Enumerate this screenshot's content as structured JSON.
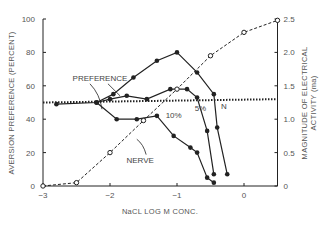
{
  "chart_data": {
    "type": "line",
    "title": "",
    "xlabel": "NaCL LOG M CONC.",
    "ylabel": "AVERSION PREFERENCE (PERCENT)",
    "y2label_line1": "MAGNITUDE OF ELECTRICAL",
    "y2label_line2": "ACTIVITY (ma)",
    "xlim": [
      -3,
      0.5
    ],
    "ylim": [
      0,
      100
    ],
    "y2lim": [
      0,
      2.5
    ],
    "xticks": [
      -3,
      -2,
      -1,
      0
    ],
    "xtick_labels": [
      "−3",
      "−2",
      "−1",
      "0"
    ],
    "yticks": [
      0,
      20,
      40,
      60,
      80,
      100
    ],
    "ytick_labels": [
      "0",
      "20",
      "40",
      "60",
      "80",
      "100"
    ],
    "y2ticks": [
      0,
      0.5,
      1.0,
      1.5,
      2.0,
      2.5
    ],
    "y2tick_labels": [
      "0",
      "0.5",
      "1.0",
      "1.5",
      "2.0",
      "2.5"
    ],
    "grid": false,
    "series": [
      {
        "name": "N",
        "style": "solid-filled",
        "axis": "left",
        "x": [
          -2.8,
          -2.2,
          -1.95,
          -1.65,
          -1.3,
          -1.0,
          -0.7,
          -0.45,
          -0.4,
          -0.25
        ],
        "y": [
          49,
          50,
          55,
          65,
          75,
          80,
          68,
          55,
          35,
          7
        ]
      },
      {
        "name": "5%",
        "style": "solid-filled",
        "axis": "left",
        "x": [
          -2.2,
          -2.0,
          -1.75,
          -1.45,
          -1.1,
          -0.85,
          -0.7,
          -0.55,
          -0.45
        ],
        "y": [
          50,
          52,
          54,
          52,
          58,
          58,
          53,
          33,
          7
        ]
      },
      {
        "name": "10%",
        "style": "solid-filled",
        "axis": "left",
        "x": [
          -2.2,
          -1.9,
          -1.6,
          -1.3,
          -1.05,
          -0.8,
          -0.7,
          -0.55,
          -0.45
        ],
        "y": [
          50,
          40,
          40,
          42,
          30,
          23,
          20,
          5,
          2
        ]
      },
      {
        "name": "NERVE",
        "style": "dashed-open",
        "axis": "right",
        "x": [
          -3.0,
          -2.5,
          -2.0,
          -1.5,
          -1.0,
          -0.5,
          0.0,
          0.5
        ],
        "y": [
          0.0,
          0.05,
          0.5,
          0.98,
          1.45,
          1.95,
          2.3,
          2.48
        ]
      },
      {
        "name": "baseline",
        "style": "dotted",
        "axis": "left",
        "x": [
          -3.0,
          0.5
        ],
        "y": [
          50,
          52
        ]
      }
    ],
    "annotations": [
      {
        "text": "PREFERENCE",
        "x": -2.15,
        "y": 63
      },
      {
        "text": "NERVE",
        "x": -1.55,
        "y": 14
      },
      {
        "text": "10%",
        "x": -1.05,
        "y": 41
      },
      {
        "text": "5%",
        "x": -0.65,
        "y": 45
      },
      {
        "text": "N",
        "x": -0.3,
        "y": 46
      }
    ]
  }
}
